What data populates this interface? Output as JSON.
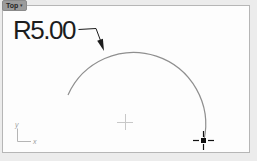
{
  "viewport": {
    "title_tab": {
      "label": "Top",
      "dropdown_glyph": "▾"
    }
  },
  "drawing": {
    "dimension_label": "R5.00",
    "axis_indicator": {
      "x_label": "x",
      "y_label": "y"
    }
  },
  "colors": {
    "viewport_border": "#b6b6b6",
    "tab_background": "#9b9b9b",
    "arc_stroke": "#8f8f8f",
    "dimension_ink": "#1c1c1c",
    "origin_marker": "#c8c8c8",
    "axis_icon": "#b5b5b5",
    "cursor_ink": "#111111"
  }
}
